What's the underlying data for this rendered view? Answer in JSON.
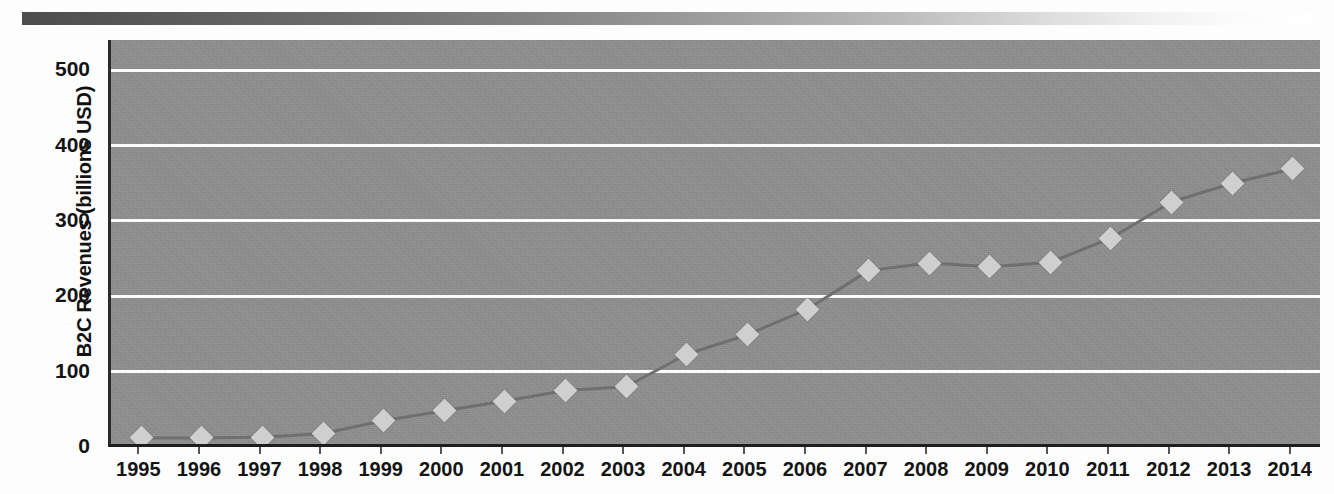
{
  "figure": {
    "top_strip": "gradient-bar",
    "background_color": "#ffffff",
    "plot_bg_color": "#8e8e8e",
    "gridline_color": "#fbfbfb",
    "marker_color": "#cfcfcf",
    "line_color": "#6f6f6f"
  },
  "chart_data": {
    "type": "line",
    "title": "",
    "xlabel": "",
    "ylabel": "B2C Revenues (billions USD)",
    "categories": [
      "1995",
      "1996",
      "1997",
      "1998",
      "1999",
      "2000",
      "2001",
      "2002",
      "2003",
      "2004",
      "2005",
      "2006",
      "2007",
      "2008",
      "2009",
      "2010",
      "2011",
      "2012",
      "2013",
      "2014"
    ],
    "values": [
      12,
      12,
      13,
      18,
      35,
      48,
      61,
      75,
      80,
      123,
      149,
      183,
      234,
      244,
      239,
      245,
      277,
      325,
      350,
      369
    ],
    "series": [
      {
        "name": "B2C Revenues",
        "values": [
          12,
          12,
          13,
          18,
          35,
          48,
          61,
          75,
          80,
          123,
          149,
          183,
          234,
          244,
          239,
          245,
          277,
          325,
          350,
          369
        ]
      }
    ],
    "ylim": [
      0,
      540
    ],
    "yticks": [
      0,
      100,
      200,
      300,
      400,
      500
    ],
    "ytick_labels": [
      "0",
      "100",
      "200",
      "300",
      "400",
      "500"
    ],
    "grid": true,
    "legend": "none",
    "marker": "diamond"
  }
}
